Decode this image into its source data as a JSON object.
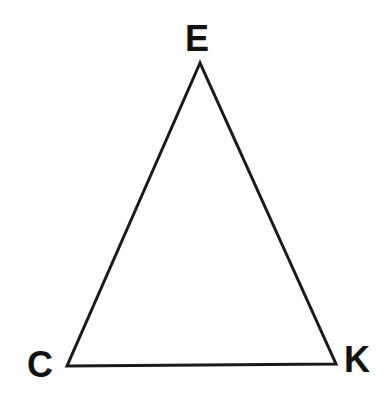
{
  "diagram": {
    "type": "triangle",
    "stroke_color": "#1a1a1a",
    "label_color": "#111111",
    "vertices": [
      {
        "label": "E",
        "x": 200,
        "y": 63
      },
      {
        "label": "C",
        "x": 67,
        "y": 366
      },
      {
        "label": "K",
        "x": 336,
        "y": 364
      }
    ]
  }
}
